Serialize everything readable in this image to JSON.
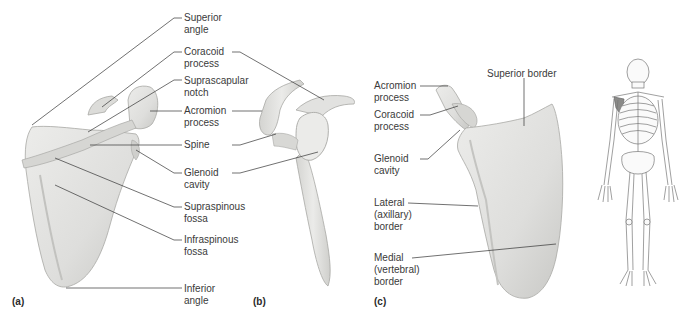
{
  "figure": {
    "panels": [
      {
        "tag": "(a)",
        "view": "posterior",
        "labels": [
          {
            "line1": "Superior",
            "line2": "angle"
          },
          {
            "line1": "Coracoid",
            "line2": "process"
          },
          {
            "line1": "Suprascapular",
            "line2": "notch"
          },
          {
            "line1": "Acromion",
            "line2": "process"
          },
          {
            "line1": "Spine",
            "line2": ""
          },
          {
            "line1": "Glenoid",
            "line2": "cavity"
          },
          {
            "line1": "Supraspinous",
            "line2": "fossa"
          },
          {
            "line1": "Infraspinous",
            "line2": "fossa"
          },
          {
            "line1": "Inferior",
            "line2": "angle"
          }
        ]
      },
      {
        "tag": "(b)",
        "view": "lateral"
      },
      {
        "tag": "(c)",
        "view": "anterior",
        "labels": [
          {
            "line1": "Acromion",
            "line2": "process",
            "line3": ""
          },
          {
            "line1": "Coracoid",
            "line2": "process",
            "line3": ""
          },
          {
            "line1": "Glenoid",
            "line2": "cavity",
            "line3": ""
          },
          {
            "line1": "Lateral",
            "line2": "(axillary)",
            "line3": "border"
          },
          {
            "line1": "Medial",
            "line2": "(vertebral)",
            "line3": "border"
          },
          {
            "line1": "Superior border",
            "line2": "",
            "line3": ""
          }
        ]
      }
    ],
    "colors": {
      "bone_fill": "#e4e4e2",
      "bone_shade": "#c9c9c6",
      "bone_edge": "#a8a8a5",
      "leader": "#333333",
      "skeleton_line": "#777777",
      "highlight": "#8a8a88"
    }
  }
}
